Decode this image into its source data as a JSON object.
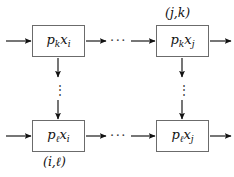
{
  "figure": {
    "type": "flow-grid-diagram",
    "background_color": "#ffffff",
    "line_color": "#111111",
    "box_border_color": "#6b6b6b",
    "text_color": "#111111"
  },
  "nodes": [
    {
      "id": "top-left",
      "base": "p",
      "base_sub": "k",
      "var": "x",
      "var_sub": "i",
      "text": "pₖxᵢ",
      "x": 32,
      "y": 25,
      "w": 53,
      "h": 32
    },
    {
      "id": "top-right",
      "base": "p",
      "base_sub": "k",
      "var": "x",
      "var_sub": "j",
      "text": "pₖxⱼ",
      "x": 156,
      "y": 25,
      "w": 53,
      "h": 32
    },
    {
      "id": "bottom-left",
      "base": "p",
      "base_sub": "ℓ",
      "var": "x",
      "var_sub": "i",
      "text": "pℓxᵢ",
      "x": 32,
      "y": 120,
      "w": 53,
      "h": 32
    },
    {
      "id": "bottom-right",
      "base": "p",
      "base_sub": "ℓ",
      "var": "x",
      "var_sub": "j",
      "text": "pℓxⱼ",
      "x": 156,
      "y": 120,
      "w": 53,
      "h": 32
    }
  ],
  "corner_labels": [
    {
      "id": "top-right-pair",
      "text": "(j,k)",
      "x": 165,
      "y": 7
    },
    {
      "id": "bottom-left-pair",
      "text": "(i,ℓ)",
      "x": 43,
      "y": 156
    }
  ],
  "ellipses": {
    "horizontal": [
      {
        "id": "top-row-dots",
        "text": "···",
        "x": 110,
        "y": 34
      },
      {
        "id": "bottom-row-dots",
        "text": "···",
        "x": 110,
        "y": 129
      }
    ],
    "vertical": [
      {
        "id": "left-col-dots",
        "text": "⋮",
        "x": 54,
        "y": 84
      },
      {
        "id": "right-col-dots",
        "text": "⋮",
        "x": 178,
        "y": 84
      }
    ]
  },
  "arrows": [
    {
      "id": "in-top-left",
      "direction": "right",
      "x1": 6,
      "y1": 41,
      "x2": 31,
      "y2": 41
    },
    {
      "id": "out-top-left",
      "direction": "right",
      "x1": 86,
      "y1": 41,
      "x2": 106,
      "y2": 41
    },
    {
      "id": "in-top-right",
      "direction": "right",
      "x1": 131,
      "y1": 41,
      "x2": 155,
      "y2": 41
    },
    {
      "id": "out-top-right",
      "direction": "right",
      "x1": 210,
      "y1": 41,
      "x2": 231,
      "y2": 41
    },
    {
      "id": "in-bottom-left",
      "direction": "right",
      "x1": 6,
      "y1": 136,
      "x2": 31,
      "y2": 136
    },
    {
      "id": "out-bottom-left",
      "direction": "right",
      "x1": 86,
      "y1": 136,
      "x2": 106,
      "y2": 136
    },
    {
      "id": "in-bottom-right",
      "direction": "right",
      "x1": 131,
      "y1": 136,
      "x2": 155,
      "y2": 136
    },
    {
      "id": "out-bottom-right",
      "direction": "right",
      "x1": 210,
      "y1": 136,
      "x2": 231,
      "y2": 136
    },
    {
      "id": "down-left-upper",
      "direction": "down",
      "x1": 58,
      "y1": 58,
      "x2": 58,
      "y2": 77
    },
    {
      "id": "down-left-lower",
      "direction": "down",
      "x1": 58,
      "y1": 100,
      "x2": 58,
      "y2": 119
    },
    {
      "id": "down-right-upper",
      "direction": "down",
      "x1": 182,
      "y1": 58,
      "x2": 182,
      "y2": 77
    },
    {
      "id": "down-right-lower",
      "direction": "down",
      "x1": 182,
      "y1": 100,
      "x2": 182,
      "y2": 119
    }
  ]
}
